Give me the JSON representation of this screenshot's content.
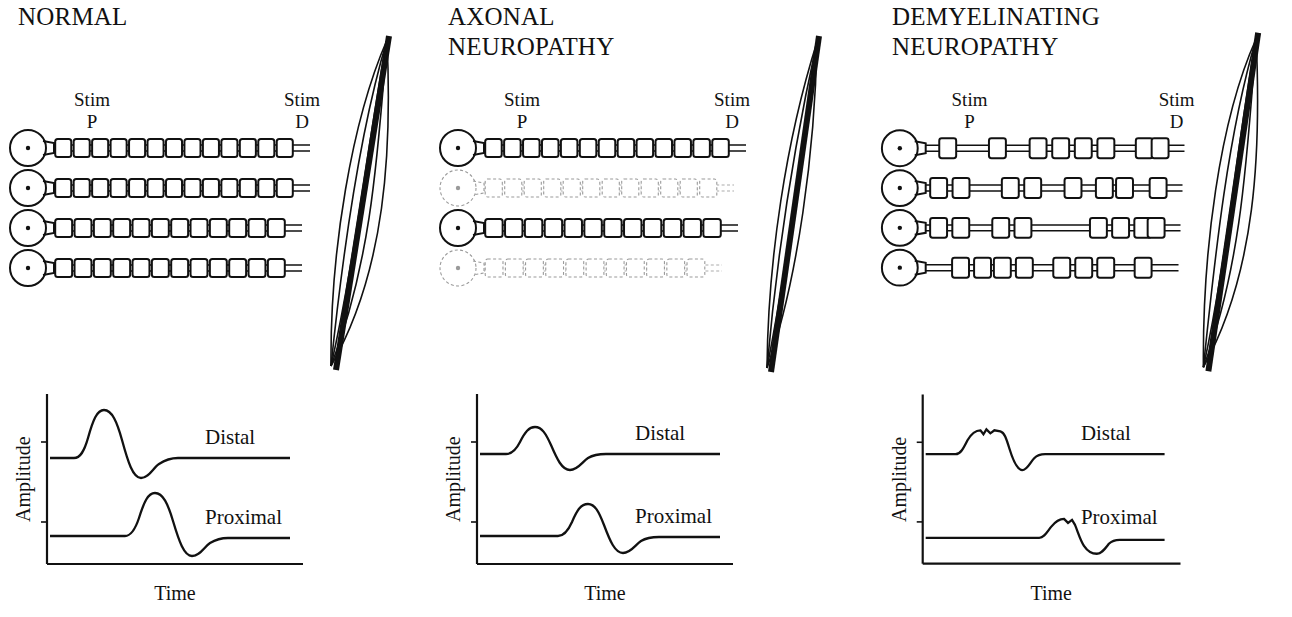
{
  "figure": {
    "kind": "medical-diagram"
  },
  "panels": [
    {
      "id": "normal",
      "title": "NORMAL",
      "stim_proximal_label": "Stim\nP",
      "stim_distal_label": "Stim\nD",
      "axons": [
        {
          "state": "intact",
          "segments": 13
        },
        {
          "state": "intact",
          "segments": 13
        },
        {
          "state": "intact",
          "segments": 12
        },
        {
          "state": "intact",
          "segments": 12
        }
      ],
      "muscle": {
        "state": "normal",
        "width": 54
      },
      "graph": {
        "ylabel": "Amplitude",
        "xlabel": "Time",
        "traces": [
          {
            "name": "Distal",
            "label": "Distal",
            "amplitude": "large",
            "latency": "short",
            "shape": "smooth-biphasic"
          },
          {
            "name": "Proximal",
            "label": "Proximal",
            "amplitude": "large",
            "latency": "long",
            "shape": "smooth-biphasic"
          }
        ]
      }
    },
    {
      "id": "axonal",
      "title": "AXONAL\nNEUROPATHY",
      "stim_proximal_label": "Stim\nP",
      "stim_distal_label": "Stim\nD",
      "axons": [
        {
          "state": "intact",
          "segments": 13
        },
        {
          "state": "degenerated",
          "segments": 12
        },
        {
          "state": "intact",
          "segments": 12
        },
        {
          "state": "degenerated",
          "segments": 11
        }
      ],
      "muscle": {
        "state": "atrophic",
        "width": 30
      },
      "graph": {
        "ylabel": "Amplitude",
        "xlabel": "Time",
        "traces": [
          {
            "name": "Distal",
            "label": "Distal",
            "amplitude": "reduced",
            "latency": "short",
            "shape": "smooth-biphasic"
          },
          {
            "name": "Proximal",
            "label": "Proximal",
            "amplitude": "reduced",
            "latency": "long",
            "shape": "smooth-biphasic"
          }
        ]
      }
    },
    {
      "id": "demyelinating",
      "title": "DEMYELINATING\nNEUROPATHY",
      "stim_proximal_label": "Stim\nP",
      "stim_distal_label": "Stim\nD",
      "axons": [
        {
          "state": "demyelinated",
          "segments": 8
        },
        {
          "state": "demyelinated",
          "segments": 8
        },
        {
          "state": "demyelinated",
          "segments": 7
        },
        {
          "state": "demyelinated",
          "segments": 8
        }
      ],
      "muscle": {
        "state": "normal",
        "width": 54
      },
      "graph": {
        "ylabel": "Amplitude",
        "xlabel": "Time",
        "traces": [
          {
            "name": "Distal",
            "label": "Distal",
            "amplitude": "reduced",
            "latency": "delayed",
            "shape": "notched-dispersed"
          },
          {
            "name": "Proximal",
            "label": "Proximal",
            "amplitude": "small",
            "latency": "very-delayed",
            "shape": "notched-dispersed"
          }
        ]
      }
    }
  ],
  "colors": {
    "ink": "#111111",
    "background": "#ffffff",
    "faded": "#9a9a9a"
  }
}
